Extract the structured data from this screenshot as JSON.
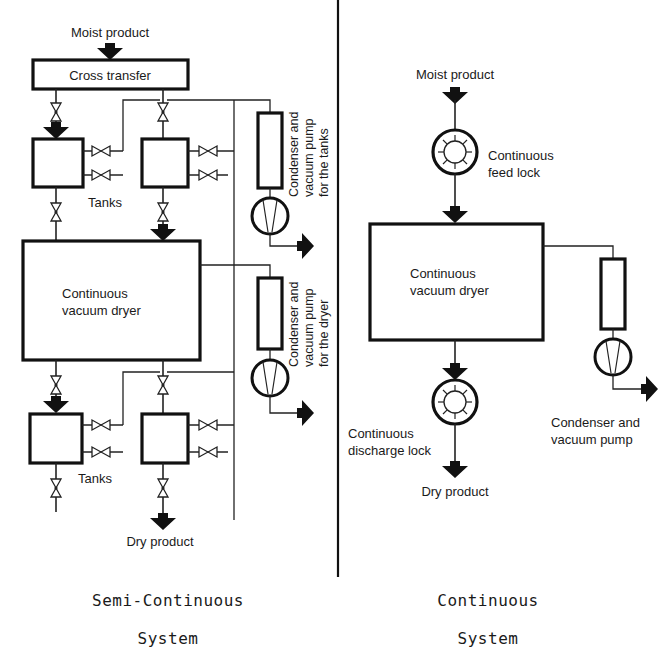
{
  "semi_continuous": {
    "moist_product_label": "Moist product",
    "cross_transfer_label": "Cross transfer",
    "tanks_upper_label": "Tanks",
    "dryer_label_line1": "Continuous",
    "dryer_label_line2": "vacuum dryer",
    "tanks_lower_label": "Tanks",
    "dry_product_label": "Dry product",
    "tank_pump_label_line1": "Condenser and",
    "tank_pump_label_line2": "vacuum pump",
    "tank_pump_label_line3": "for the tanks",
    "dryer_pump_label_line1": "Condenser and",
    "dryer_pump_label_line2": "vacuum pump",
    "dryer_pump_label_line3": "for the dryer",
    "caption_line1": "Semi-Continuous",
    "caption_line2": "System"
  },
  "continuous": {
    "moist_product_label": "Moist product",
    "feed_lock_label_line1": "Continuous",
    "feed_lock_label_line2": "feed lock",
    "dryer_label_line1": "Continuous",
    "dryer_label_line2": "vacuum dryer",
    "discharge_lock_label_line1": "Continuous",
    "discharge_lock_label_line2": "discharge lock",
    "dry_product_label": "Dry product",
    "pump_label_line1": "Condenser and",
    "pump_label_line2": "vacuum pump",
    "caption_line1": "Continuous",
    "caption_line2": "System"
  },
  "colors": {
    "line": "#111111",
    "background": "#ffffff"
  }
}
